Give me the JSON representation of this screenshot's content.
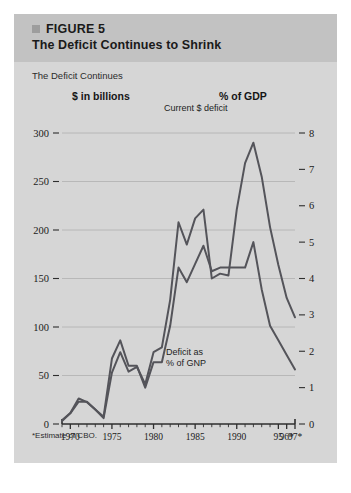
{
  "figure": {
    "marker_icon": "filled-square-icon",
    "label": "FIGURE 5",
    "title": "The Deficit Continues to Shrink",
    "subtitle": "The Deficit Continues",
    "left_unit": "$ in billions",
    "right_unit": "% of GDP",
    "footnote": "*Estimate of CBO."
  },
  "colors": {
    "card_bg": "#d6d6d6",
    "header_bg": "#c2c2c2",
    "line": "#54545a",
    "grid": "#b0b0b0",
    "axis": "#2e2e2e",
    "text": "#1a1a1a"
  },
  "annotations": {
    "current_deficit": "Current $ deficit",
    "deficit_gnp_line1": "Deficit as",
    "deficit_gnp_line2": "% of GNP"
  },
  "chart_data": {
    "type": "line",
    "title": "The Deficit Continues to Shrink",
    "subtitle": "The Deficit Continues",
    "xlabel": "",
    "ylabel": "$ in billions",
    "y2label": "% of GDP",
    "ylim": [
      0,
      300
    ],
    "y2lim": [
      0,
      8
    ],
    "xlim": [
      1969,
      1997
    ],
    "grid": true,
    "legend": "annotations-inline",
    "yticks": [
      0,
      50,
      100,
      150,
      200,
      250,
      300
    ],
    "ytick_labels": [
      "0",
      "50",
      "100",
      "150",
      "200",
      "250",
      "300"
    ],
    "y2ticks": [
      0,
      1,
      2,
      3,
      4,
      5,
      6,
      7,
      8
    ],
    "y2tick_labels": [
      "0",
      "1",
      "2",
      "3",
      "4",
      "5",
      "6",
      "7",
      "8"
    ],
    "xticks": [
      1970,
      1975,
      1980,
      1985,
      1990,
      1995,
      1996,
      1997
    ],
    "xtick_labels": [
      "1970",
      "1975",
      "1980",
      "1985",
      "1990",
      "95",
      "96*",
      "97*"
    ],
    "x": [
      1969,
      1970,
      1971,
      1972,
      1973,
      1974,
      1975,
      1976,
      1977,
      1978,
      1979,
      1980,
      1981,
      1982,
      1983,
      1984,
      1985,
      1986,
      1987,
      1988,
      1989,
      1990,
      1991,
      1992,
      1993,
      1994,
      1995,
      1996,
      1997
    ],
    "series": [
      {
        "name": "Current $ deficit",
        "axis": "left",
        "units": "$ billions",
        "values": [
          3,
          11,
          23,
          23,
          15,
          6,
          53,
          74,
          54,
          59,
          41,
          74,
          79,
          128,
          208,
          185,
          212,
          221,
          150,
          155,
          153,
          221,
          269,
          290,
          255,
          203,
          164,
          130,
          110
        ]
      },
      {
        "name": "Deficit as % of GNP",
        "axis": "right",
        "units": "percent of GNP",
        "values": [
          0.1,
          0.3,
          0.7,
          0.6,
          0.4,
          0.2,
          1.8,
          2.3,
          1.6,
          1.6,
          1.0,
          1.7,
          1.7,
          2.7,
          4.3,
          3.9,
          4.4,
          4.9,
          4.2,
          4.3,
          4.3,
          4.3,
          4.3,
          5.0,
          3.7,
          2.7,
          2.3,
          1.9,
          1.5
        ]
      }
    ],
    "peaks": [
      {
        "series": "Current $ deficit",
        "x": 1992,
        "y": 290
      },
      {
        "series": "Deficit as % of GNP",
        "x": 1992,
        "y": 5.0
      }
    ]
  }
}
